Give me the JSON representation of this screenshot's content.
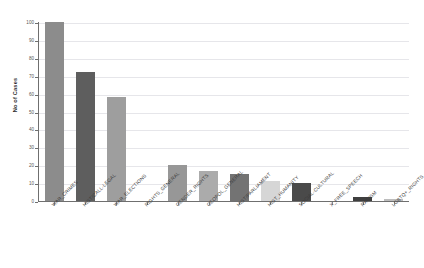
{
  "chart_data": {
    "type": "bar",
    "title": "",
    "xlabel": "",
    "ylabel": "No of Cases",
    "ylim": [
      0,
      100
    ],
    "grid": true,
    "legend": false,
    "yticks": [
      0,
      10,
      20,
      30,
      40,
      50,
      60,
      70,
      80,
      90,
      100
    ],
    "ytick_labels": [
      "0",
      "10",
      "20",
      "30",
      "40",
      "50",
      "60",
      "70",
      "80",
      "90",
      "100"
    ],
    "categories": [
      "WAR_CRIMES",
      "HIST/CALL-LEGAL",
      "WAR_ELECTIONS",
      "RIGHTS_GENERAL",
      "GENDER_RIGHTS",
      "GEOPOL_GENERAL",
      "HIST/PARLIAMENT",
      "HIST_HUMANITY",
      "SOCIAL-CULTURAL",
      "X_FREE_SPEECH",
      "RACISM",
      "LGBTQ+_RIGHTS"
    ],
    "values": [
      100,
      72,
      58,
      0,
      20,
      17,
      15,
      11,
      10,
      0,
      2,
      1
    ],
    "bar_colors": [
      "#8c8c8c",
      "#5e5e5e",
      "#9e9e9e",
      "#f2f2f2",
      "#979797",
      "#ababab",
      "#737373",
      "#d6d6d6",
      "#4a4a4a",
      "#ededed",
      "#3f3f3f",
      "#bdbdbd"
    ],
    "axis_color": "#6f6f6f",
    "grid_color": "#e6e6ea",
    "background": "#ffffff"
  }
}
